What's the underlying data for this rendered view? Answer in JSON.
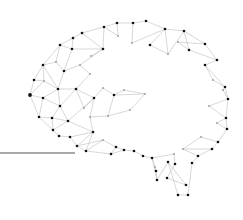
{
  "graphic": {
    "subject": "brain-network-icon",
    "description": "Low-poly plexus network of nodes and edges forming a brain shaped like a speech bubble, with a horizontal line extending left",
    "colors": {
      "background": "#ffffff",
      "node": "#111111",
      "node_light": "#9a9a9a",
      "edge": "#bdbdbd",
      "line": "#555555"
    },
    "baseline": {
      "x1": 0,
      "y1": 153,
      "x2": 75,
      "y2": 153
    },
    "nodes": [
      [
        117,
        23,
        "d"
      ],
      [
        133,
        23,
        "d"
      ],
      [
        146,
        21,
        "d"
      ],
      [
        104,
        27,
        "d"
      ],
      [
        82,
        33,
        "d"
      ],
      [
        73,
        38,
        "d"
      ],
      [
        60,
        45,
        "d"
      ],
      [
        72,
        49,
        "d"
      ],
      [
        103,
        49,
        "d"
      ],
      [
        91,
        56,
        "l"
      ],
      [
        118,
        36,
        "l"
      ],
      [
        132,
        43,
        "l"
      ],
      [
        43,
        65,
        "d"
      ],
      [
        64,
        71,
        "d"
      ],
      [
        56,
        62,
        "l"
      ],
      [
        80,
        65,
        "l"
      ],
      [
        34,
        80,
        "d"
      ],
      [
        44,
        81,
        "l"
      ],
      [
        58,
        89,
        "d"
      ],
      [
        76,
        89,
        "d"
      ],
      [
        90,
        74,
        "l"
      ],
      [
        30,
        95,
        "d"
      ],
      [
        43,
        98,
        "d"
      ],
      [
        60,
        106,
        "d"
      ],
      [
        94,
        98,
        "d"
      ],
      [
        103,
        88,
        "l"
      ],
      [
        114,
        95,
        "d"
      ],
      [
        124,
        90,
        "l"
      ],
      [
        145,
        94,
        "l"
      ],
      [
        130,
        110,
        "l"
      ],
      [
        108,
        116,
        "l"
      ],
      [
        84,
        108,
        "l"
      ],
      [
        90,
        117,
        "l"
      ],
      [
        39,
        117,
        "d"
      ],
      [
        52,
        118,
        "d"
      ],
      [
        68,
        121,
        "d"
      ],
      [
        53,
        130,
        "d"
      ],
      [
        59,
        136,
        "d"
      ],
      [
        70,
        137,
        "d"
      ],
      [
        93,
        132,
        "d"
      ],
      [
        77,
        146,
        "d"
      ],
      [
        86,
        151,
        "d"
      ],
      [
        103,
        140,
        "l"
      ],
      [
        116,
        147,
        "d"
      ],
      [
        111,
        154,
        "d"
      ],
      [
        124,
        150,
        "d"
      ],
      [
        134,
        151,
        "d"
      ],
      [
        143,
        156,
        "d"
      ],
      [
        152,
        158,
        "d"
      ],
      [
        155,
        167,
        "l"
      ],
      [
        156,
        171,
        "d"
      ],
      [
        157,
        180,
        "d"
      ],
      [
        168,
        162,
        "d"
      ],
      [
        174,
        154,
        "l"
      ],
      [
        175,
        164,
        "d"
      ],
      [
        167,
        178,
        "d"
      ],
      [
        186,
        185,
        "d"
      ],
      [
        178,
        195,
        "d"
      ],
      [
        188,
        195,
        "d"
      ],
      [
        192,
        163,
        "d"
      ],
      [
        198,
        156,
        "d"
      ],
      [
        212,
        149,
        "d"
      ],
      [
        218,
        142,
        "d"
      ],
      [
        201,
        137,
        "l"
      ],
      [
        183,
        149,
        "l"
      ],
      [
        227,
        129,
        "d"
      ],
      [
        226,
        118,
        "d"
      ],
      [
        217,
        123,
        "l"
      ],
      [
        209,
        106,
        "l"
      ],
      [
        228,
        99,
        "d"
      ],
      [
        225,
        87,
        "d"
      ],
      [
        223,
        90,
        "l"
      ],
      [
        213,
        80,
        "l"
      ],
      [
        205,
        65,
        "d"
      ],
      [
        217,
        60,
        "d"
      ],
      [
        205,
        44,
        "d"
      ],
      [
        184,
        31,
        "d"
      ],
      [
        189,
        50,
        "d"
      ],
      [
        178,
        42,
        "l"
      ],
      [
        165,
        29,
        "d"
      ],
      [
        168,
        54,
        "l"
      ],
      [
        150,
        45,
        "d"
      ]
    ],
    "edges": [
      [
        0,
        1
      ],
      [
        1,
        2
      ],
      [
        0,
        3
      ],
      [
        3,
        4
      ],
      [
        4,
        5
      ],
      [
        5,
        6
      ],
      [
        2,
        79
      ],
      [
        79,
        76
      ],
      [
        76,
        75
      ],
      [
        75,
        74
      ],
      [
        74,
        73
      ],
      [
        73,
        70
      ],
      [
        70,
        69
      ],
      [
        69,
        66
      ],
      [
        66,
        65
      ],
      [
        65,
        62
      ],
      [
        62,
        61
      ],
      [
        61,
        60
      ],
      [
        60,
        59
      ],
      [
        59,
        58
      ],
      [
        6,
        12
      ],
      [
        12,
        16
      ],
      [
        16,
        21
      ],
      [
        21,
        33
      ],
      [
        33,
        36
      ],
      [
        36,
        37
      ],
      [
        37,
        38
      ],
      [
        38,
        40
      ],
      [
        40,
        41
      ],
      [
        41,
        44
      ],
      [
        44,
        45
      ],
      [
        45,
        46
      ],
      [
        46,
        47
      ],
      [
        47,
        48
      ],
      [
        48,
        51
      ],
      [
        51,
        52
      ],
      [
        52,
        57
      ],
      [
        57,
        58
      ],
      [
        52,
        56
      ],
      [
        56,
        55
      ],
      [
        55,
        54
      ],
      [
        54,
        53
      ],
      [
        53,
        48
      ],
      [
        49,
        50
      ],
      [
        50,
        51
      ],
      [
        49,
        48
      ],
      [
        3,
        8
      ],
      [
        4,
        8
      ],
      [
        5,
        7
      ],
      [
        7,
        8
      ],
      [
        8,
        9
      ],
      [
        6,
        7
      ],
      [
        7,
        13
      ],
      [
        6,
        14
      ],
      [
        14,
        12
      ],
      [
        14,
        13
      ],
      [
        13,
        15
      ],
      [
        15,
        8
      ],
      [
        13,
        18
      ],
      [
        12,
        18
      ],
      [
        12,
        17
      ],
      [
        16,
        17
      ],
      [
        17,
        18
      ],
      [
        18,
        19
      ],
      [
        19,
        20
      ],
      [
        20,
        15
      ],
      [
        19,
        24
      ],
      [
        18,
        22
      ],
      [
        17,
        21
      ],
      [
        21,
        22
      ],
      [
        22,
        23
      ],
      [
        23,
        18
      ],
      [
        23,
        19
      ],
      [
        22,
        33
      ],
      [
        33,
        34
      ],
      [
        34,
        23
      ],
      [
        34,
        35
      ],
      [
        35,
        23
      ],
      [
        35,
        24
      ],
      [
        24,
        31
      ],
      [
        31,
        19
      ],
      [
        24,
        25
      ],
      [
        25,
        26
      ],
      [
        26,
        27
      ],
      [
        27,
        28
      ],
      [
        28,
        26
      ],
      [
        26,
        30
      ],
      [
        30,
        29
      ],
      [
        29,
        28
      ],
      [
        24,
        32
      ],
      [
        32,
        30
      ],
      [
        35,
        39
      ],
      [
        39,
        32
      ],
      [
        34,
        36
      ],
      [
        36,
        35
      ],
      [
        38,
        39
      ],
      [
        39,
        41
      ],
      [
        39,
        40
      ],
      [
        40,
        42
      ],
      [
        42,
        43
      ],
      [
        43,
        44
      ],
      [
        43,
        45
      ],
      [
        42,
        41
      ],
      [
        0,
        10
      ],
      [
        10,
        3
      ],
      [
        1,
        11
      ],
      [
        11,
        79
      ],
      [
        79,
        80
      ],
      [
        80,
        76
      ],
      [
        80,
        81
      ],
      [
        81,
        79
      ],
      [
        77,
        76
      ],
      [
        77,
        78
      ],
      [
        78,
        75
      ],
      [
        77,
        74
      ],
      [
        73,
        72
      ],
      [
        72,
        70
      ],
      [
        71,
        70
      ],
      [
        71,
        69
      ],
      [
        68,
        69
      ],
      [
        68,
        66
      ],
      [
        67,
        66
      ],
      [
        67,
        65
      ],
      [
        63,
        62
      ],
      [
        63,
        64
      ],
      [
        64,
        61
      ],
      [
        64,
        60
      ]
    ]
  }
}
